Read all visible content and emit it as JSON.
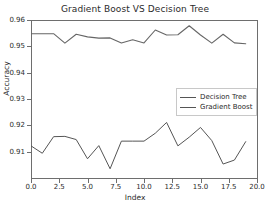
{
  "chart_data": {
    "type": "line",
    "title": "Gradient Boost VS Decision Tree",
    "xlabel": "Index",
    "ylabel": "Accuracy",
    "xlim": [
      0.0,
      20.0
    ],
    "ylim": [
      0.9,
      0.96
    ],
    "grid": false,
    "legend_position": "center right",
    "xticks": [
      "0.0",
      "2.5",
      "5.0",
      "7.5",
      "10.0",
      "12.5",
      "15.0",
      "17.5",
      "20.0"
    ],
    "xtick_values": [
      0.0,
      2.5,
      5.0,
      7.5,
      10.0,
      12.5,
      15.0,
      17.5,
      20.0
    ],
    "yticks": [
      "0.91",
      "0.92",
      "0.93",
      "0.94",
      "0.95",
      "0.96"
    ],
    "ytick_values": [
      0.91,
      0.92,
      0.93,
      0.94,
      0.95,
      0.96
    ],
    "x": [
      0,
      1,
      2,
      3,
      4,
      5,
      6,
      7,
      8,
      9,
      10,
      11,
      12,
      13,
      14,
      15,
      16,
      17,
      18,
      19
    ],
    "series": [
      {
        "name": "Decision Tree",
        "color": "#555555",
        "values": [
          0.9122,
          0.9094,
          0.9157,
          0.9158,
          0.9146,
          0.9073,
          0.9123,
          0.9035,
          0.914,
          0.914,
          0.914,
          0.917,
          0.9211,
          0.9122,
          0.9155,
          0.9192,
          0.9142,
          0.9053,
          0.9068,
          0.9138
        ]
      },
      {
        "name": "Gradient Boost",
        "color": "#666666",
        "values": [
          0.9548,
          0.9548,
          0.9548,
          0.9512,
          0.9546,
          0.9536,
          0.9531,
          0.9532,
          0.9513,
          0.9525,
          0.9513,
          0.9562,
          0.9543,
          0.9544,
          0.9578,
          0.9543,
          0.9512,
          0.9546,
          0.9513,
          0.951
        ]
      }
    ]
  },
  "legend": {
    "entries": [
      {
        "label": "Decision Tree"
      },
      {
        "label": "Gradient Boost"
      }
    ]
  }
}
